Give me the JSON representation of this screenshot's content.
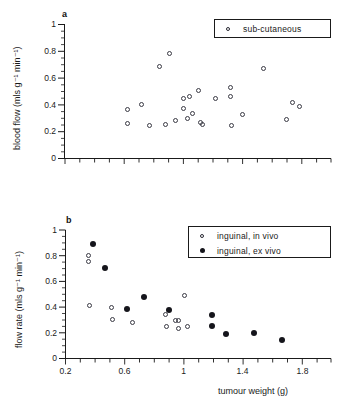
{
  "figure": {
    "panels": [
      {
        "id": "a",
        "label": "a",
        "ylabel": "blood flow (mls g⁻¹ min⁻¹)",
        "xlabel": "",
        "ylim": [
          0,
          1
        ],
        "xlim": [
          0.2,
          2.0
        ],
        "yticks": [
          "0",
          "0.2",
          "0.4",
          "0.6",
          "0.8",
          "1"
        ],
        "ytickvals": [
          0,
          0.2,
          0.4,
          0.6,
          0.8,
          1
        ],
        "xticks": [],
        "xtickvals": [],
        "legend": {
          "position": "top-right",
          "entries": [
            {
              "marker": "open-circle",
              "label": "sub-cutaneous"
            }
          ]
        }
      },
      {
        "id": "b",
        "label": "b",
        "ylabel": "flow rate (mls g⁻¹ min⁻¹)",
        "xlabel": "tumour weight (g)",
        "ylim": [
          0,
          1
        ],
        "xlim": [
          0.2,
          2.0
        ],
        "yticks": [
          "0",
          "0.2",
          "0.4",
          "0.6",
          "0.8",
          "1"
        ],
        "ytickvals": [
          0,
          0.2,
          0.4,
          0.6,
          0.8,
          1
        ],
        "xticks": [
          "0.2",
          "0.6",
          "1",
          "1.4",
          "1.8"
        ],
        "xtickvals": [
          0.2,
          0.6,
          1.0,
          1.4,
          1.8
        ],
        "legend": {
          "position": "top-right",
          "entries": [
            {
              "marker": "open-circle",
              "label": "inguinal,  in  vivo"
            },
            {
              "marker": "filled-circle",
              "label": "inguinal,  ex  vivo"
            }
          ]
        }
      }
    ]
  },
  "chart_data": [
    {
      "type": "scatter",
      "panel": "a",
      "title": "a",
      "xlabel": "tumour weight (g)",
      "ylabel": "blood flow (mls g-1 min-1)",
      "xlim": [
        0.2,
        2.0
      ],
      "ylim": [
        0,
        1
      ],
      "grid": false,
      "legend_position": "top-right",
      "series": [
        {
          "name": "sub-cutaneous",
          "marker": "open-circle",
          "points": [
            [
              0.62,
              0.365
            ],
            [
              0.62,
              0.26
            ],
            [
              0.72,
              0.405
            ],
            [
              0.77,
              0.245
            ],
            [
              0.84,
              0.69
            ],
            [
              0.88,
              0.255
            ],
            [
              0.91,
              0.785
            ],
            [
              0.95,
              0.28
            ],
            [
              1.0,
              0.445
            ],
            [
              1.0,
              0.37
            ],
            [
              1.03,
              0.295
            ],
            [
              1.04,
              0.46
            ],
            [
              1.06,
              0.335
            ],
            [
              1.1,
              0.505
            ],
            [
              1.12,
              0.27
            ],
            [
              1.13,
              0.255
            ],
            [
              1.22,
              0.445
            ],
            [
              1.32,
              0.53
            ],
            [
              1.32,
              0.46
            ],
            [
              1.33,
              0.245
            ],
            [
              1.4,
              0.33
            ],
            [
              1.54,
              0.675
            ],
            [
              1.7,
              0.29
            ],
            [
              1.74,
              0.42
            ],
            [
              1.79,
              0.39
            ]
          ]
        }
      ]
    },
    {
      "type": "scatter",
      "panel": "b",
      "title": "b",
      "xlabel": "tumour weight (g)",
      "ylabel": "flow rate (mls g-1 min-1)",
      "xlim": [
        0.2,
        2.0
      ],
      "ylim": [
        0,
        1
      ],
      "grid": false,
      "legend_position": "top-right",
      "series": [
        {
          "name": "inguinal, in vivo",
          "marker": "open-circle",
          "points": [
            [
              0.355,
              0.8
            ],
            [
              0.355,
              0.755
            ],
            [
              0.36,
              0.415
            ],
            [
              0.515,
              0.4
            ],
            [
              0.52,
              0.3
            ],
            [
              0.655,
              0.28
            ],
            [
              0.875,
              0.345
            ],
            [
              0.885,
              0.25
            ],
            [
              0.945,
              0.295
            ],
            [
              0.965,
              0.295
            ],
            [
              0.965,
              0.23
            ],
            [
              1.01,
              0.49
            ],
            [
              1.025,
              0.25
            ]
          ]
        },
        {
          "name": "inguinal, ex vivo",
          "marker": "filled-circle",
          "points": [
            [
              0.385,
              0.89
            ],
            [
              0.47,
              0.705
            ],
            [
              0.615,
              0.385
            ],
            [
              0.73,
              0.475
            ],
            [
              0.905,
              0.38
            ],
            [
              1.19,
              0.34
            ],
            [
              1.195,
              0.25
            ],
            [
              1.29,
              0.19
            ],
            [
              1.475,
              0.2
            ],
            [
              1.665,
              0.145
            ]
          ]
        }
      ]
    }
  ]
}
